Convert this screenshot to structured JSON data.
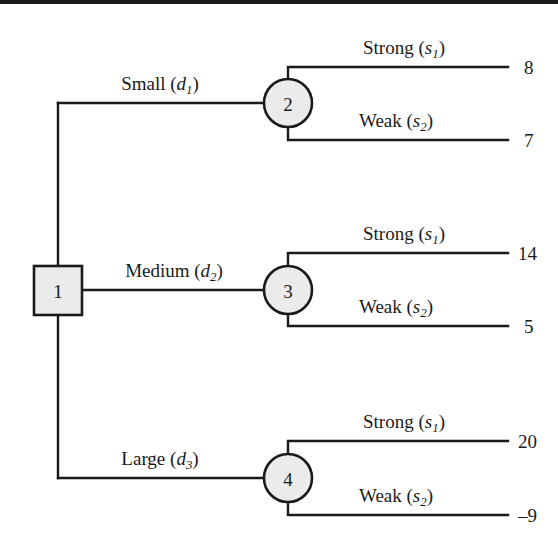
{
  "figure": {
    "type": "decision-tree",
    "background": "#ffffff",
    "line_color": "#1a1a1a",
    "node_fill": "#ebebeb"
  },
  "nodes": {
    "decision": {
      "id": "1",
      "shape": "square",
      "label": "1"
    },
    "chance": [
      {
        "id": "2",
        "shape": "circle",
        "label": "2"
      },
      {
        "id": "3",
        "shape": "circle",
        "label": "3"
      },
      {
        "id": "4",
        "shape": "circle",
        "label": "4"
      }
    ]
  },
  "branches": [
    {
      "name": "small",
      "label_text": "Small",
      "symbol_letter": "d",
      "symbol_sub": "1",
      "chance_node": "2",
      "outcomes": [
        {
          "name": "strong",
          "label_text": "Strong",
          "symbol_letter": "s",
          "symbol_sub": "1",
          "payoff": "8"
        },
        {
          "name": "weak",
          "label_text": "Weak",
          "symbol_letter": "s",
          "symbol_sub": "2",
          "payoff": "7"
        }
      ]
    },
    {
      "name": "medium",
      "label_text": "Medium",
      "symbol_letter": "d",
      "symbol_sub": "2",
      "chance_node": "3",
      "outcomes": [
        {
          "name": "strong",
          "label_text": "Strong",
          "symbol_letter": "s",
          "symbol_sub": "1",
          "payoff": "14"
        },
        {
          "name": "weak",
          "label_text": "Weak",
          "symbol_letter": "s",
          "symbol_sub": "2",
          "payoff": "5"
        }
      ]
    },
    {
      "name": "large",
      "label_text": "Large",
      "symbol_letter": "d",
      "symbol_sub": "3",
      "chance_node": "4",
      "outcomes": [
        {
          "name": "strong",
          "label_text": "Strong",
          "symbol_letter": "s",
          "symbol_sub": "1",
          "payoff": "20"
        },
        {
          "name": "weak",
          "label_text": "Weak",
          "symbol_letter": "s",
          "symbol_sub": "2",
          "payoff": "–9"
        }
      ]
    }
  ]
}
